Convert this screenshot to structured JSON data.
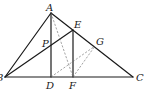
{
  "diagram": {
    "type": "geometry",
    "points": {
      "A": {
        "label": "A",
        "x": 51,
        "y": 13,
        "lx": 46,
        "ly": 11
      },
      "B": {
        "label": "B",
        "x": 5,
        "y": 77,
        "lx": -4,
        "ly": 81
      },
      "C": {
        "label": "C",
        "x": 133,
        "y": 77,
        "lx": 136,
        "ly": 81
      },
      "D": {
        "label": "D",
        "x": 51,
        "y": 77,
        "lx": 46,
        "ly": 89
      },
      "E": {
        "label": "E",
        "x": 73,
        "y": 30,
        "lx": 74,
        "ly": 28
      },
      "F": {
        "label": "F",
        "x": 73,
        "y": 77,
        "lx": 69,
        "ly": 89
      },
      "G": {
        "label": "G",
        "x": 95,
        "y": 46,
        "lx": 96,
        "ly": 45
      },
      "P": {
        "label": "P",
        "x": 51,
        "y": 46,
        "lx": 42,
        "ly": 47
      }
    },
    "segments": [
      {
        "from": "A",
        "to": "B",
        "style": "solid"
      },
      {
        "from": "A",
        "to": "C",
        "style": "solid"
      },
      {
        "from": "B",
        "to": "C",
        "style": "solid"
      },
      {
        "from": "A",
        "to": "D",
        "style": "solid"
      },
      {
        "from": "B",
        "to": "E",
        "style": "solid"
      },
      {
        "from": "E",
        "to": "F",
        "style": "solid"
      },
      {
        "from": "A",
        "to": "F",
        "style": "dashed"
      },
      {
        "from": "D",
        "to": "G",
        "style": "dashed"
      },
      {
        "from": "F",
        "to": "G",
        "style": "dashed"
      }
    ]
  }
}
